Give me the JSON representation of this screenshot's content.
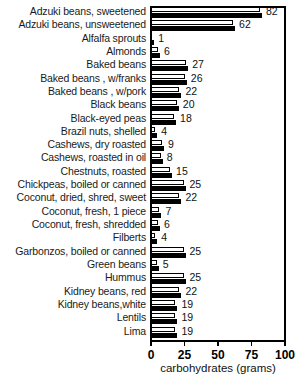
{
  "chart_data": {
    "type": "bar",
    "orientation": "horizontal",
    "title": "",
    "xlabel": "carbohydrates (grams)",
    "ylabel": "",
    "xlim": [
      0,
      100
    ],
    "xticks": [
      0,
      25,
      50,
      75,
      100
    ],
    "xtick_labels": [
      "0",
      "25",
      "50",
      "75",
      "100"
    ],
    "grid": false,
    "legend": null,
    "categories": [
      "Adzuki beans, sweetened",
      "Adzuki beans, unsweetened",
      "Alfalfa sprouts",
      "Almonds",
      "Baked beans",
      "Baked beans , w/franks",
      "Baked beans , w/pork",
      "Black beans",
      "Black-eyed peas",
      "Brazil nuts, shelled",
      "Cashews, dry roasted",
      "Cashews, roasted in oil",
      "Chestnuts, roasted",
      "Chickpeas, boiled or canned",
      "Coconut, dried, shred, sweet",
      "Coconut, fresh, 1 piece",
      "Coconut, fresh, shredded",
      "Filberts",
      "Garbonzos, boiled or canned",
      "Green beans",
      "Hummus",
      "Kidney beans, red",
      "Kidney beans,white",
      "Lentils",
      "Lima"
    ],
    "values": [
      82,
      62,
      1,
      6,
      27,
      26,
      22,
      20,
      18,
      4,
      9,
      8,
      15,
      25,
      22,
      7,
      6,
      4,
      25,
      5,
      25,
      22,
      19,
      19,
      19
    ],
    "value_labels": [
      "82",
      "62",
      "1",
      "6",
      "27",
      "26",
      "22",
      "20",
      "18",
      "4",
      "9",
      "8",
      "15",
      "25",
      "22",
      "7",
      "6",
      "4",
      "25",
      "5",
      "25",
      "22",
      "19",
      "19",
      "19"
    ]
  },
  "colors": {
    "bar_face": "#ffffff",
    "bar_outline": "#000000",
    "bar_shadow": "#000000",
    "axis": "#000000",
    "text": "#000000",
    "background": "#ffffff"
  }
}
